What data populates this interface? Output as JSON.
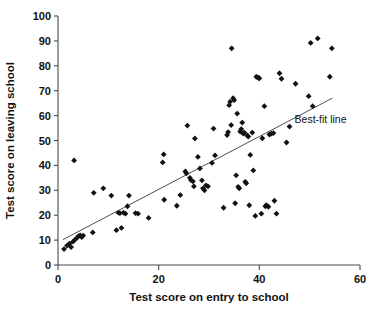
{
  "chart_data": {
    "type": "scatter",
    "title": "",
    "xlabel": "Test score on entry to school",
    "ylabel": "Test score on leaving school",
    "xlim": [
      0,
      60
    ],
    "ylim": [
      0,
      100
    ],
    "xticks": [
      0,
      20,
      40,
      60
    ],
    "yticks": [
      0,
      10,
      20,
      30,
      40,
      50,
      60,
      70,
      80,
      90,
      100
    ],
    "grid": false,
    "legend_position": "inside-right",
    "annotations": [
      {
        "name": "best-fit-line-label",
        "text": "Best-fit line",
        "x": 47,
        "y": 57
      }
    ],
    "series": [
      {
        "name": "students",
        "marker": "diamond",
        "color": "#111111",
        "points": [
          [
            1.2,
            6.4
          ],
          [
            1.8,
            7.8
          ],
          [
            2.3,
            8.6
          ],
          [
            2.6,
            7.2
          ],
          [
            3.0,
            9.4
          ],
          [
            3.2,
            42.0
          ],
          [
            3.4,
            10.2
          ],
          [
            3.8,
            11.0
          ],
          [
            4.1,
            11.6
          ],
          [
            4.4,
            11.9
          ],
          [
            4.7,
            11.2
          ],
          [
            5.0,
            11.8
          ],
          [
            6.9,
            13.1
          ],
          [
            7.1,
            29.0
          ],
          [
            9.0,
            30.8
          ],
          [
            10.6,
            27.9
          ],
          [
            11.6,
            14.0
          ],
          [
            12.0,
            21.0
          ],
          [
            12.3,
            20.8
          ],
          [
            12.6,
            14.9
          ],
          [
            13.0,
            21.0
          ],
          [
            13.4,
            20.6
          ],
          [
            13.8,
            23.6
          ],
          [
            14.1,
            27.9
          ],
          [
            15.4,
            20.8
          ],
          [
            15.9,
            20.6
          ],
          [
            18.0,
            18.9
          ],
          [
            20.8,
            41.2
          ],
          [
            21.0,
            44.4
          ],
          [
            21.1,
            26.2
          ],
          [
            23.6,
            23.8
          ],
          [
            24.3,
            28.1
          ],
          [
            25.3,
            37.6
          ],
          [
            25.5,
            36.8
          ],
          [
            25.7,
            56.0
          ],
          [
            26.2,
            35.0
          ],
          [
            26.4,
            34.1
          ],
          [
            26.8,
            33.6
          ],
          [
            27.0,
            31.6
          ],
          [
            27.2,
            50.8
          ],
          [
            27.8,
            43.4
          ],
          [
            28.2,
            38.8
          ],
          [
            28.6,
            34.0
          ],
          [
            28.8,
            30.8
          ],
          [
            29.1,
            30.0
          ],
          [
            29.4,
            32.0
          ],
          [
            29.8,
            31.6
          ],
          [
            30.6,
            41.0
          ],
          [
            30.9,
            54.8
          ],
          [
            31.2,
            44.0
          ],
          [
            32.9,
            23.0
          ],
          [
            33.6,
            52.2
          ],
          [
            33.8,
            53.4
          ],
          [
            34.0,
            64.2
          ],
          [
            34.2,
            65.6
          ],
          [
            34.4,
            56.2
          ],
          [
            34.5,
            87.0
          ],
          [
            34.8,
            67.0
          ],
          [
            35.0,
            66.2
          ],
          [
            35.2,
            24.8
          ],
          [
            35.4,
            36.0
          ],
          [
            35.6,
            60.8
          ],
          [
            35.8,
            31.4
          ],
          [
            36.0,
            30.8
          ],
          [
            36.2,
            53.6
          ],
          [
            36.4,
            54.6
          ],
          [
            36.6,
            57.2
          ],
          [
            36.8,
            52.8
          ],
          [
            37.0,
            53.2
          ],
          [
            37.2,
            33.4
          ],
          [
            37.4,
            32.8
          ],
          [
            37.6,
            52.0
          ],
          [
            37.8,
            51.6
          ],
          [
            38.0,
            24.0
          ],
          [
            38.2,
            44.2
          ],
          [
            38.6,
            53.2
          ],
          [
            38.8,
            38.0
          ],
          [
            39.2,
            19.7
          ],
          [
            39.4,
            75.6
          ],
          [
            39.8,
            75.2
          ],
          [
            40.0,
            75.0
          ],
          [
            40.4,
            20.6
          ],
          [
            40.6,
            50.9
          ],
          [
            41.0,
            63.8
          ],
          [
            41.2,
            23.6
          ],
          [
            41.4,
            24.0
          ],
          [
            41.8,
            23.4
          ],
          [
            42.0,
            52.4
          ],
          [
            42.4,
            52.8
          ],
          [
            42.8,
            53.0
          ],
          [
            43.0,
            25.8
          ],
          [
            43.4,
            20.6
          ],
          [
            44.0,
            77.0
          ],
          [
            44.4,
            74.8
          ],
          [
            45.4,
            49.2
          ],
          [
            46.0,
            55.6
          ],
          [
            47.2,
            72.8
          ],
          [
            49.8,
            67.8
          ],
          [
            50.2,
            89.2
          ],
          [
            50.6,
            63.8
          ],
          [
            51.6,
            91.0
          ],
          [
            54.0,
            75.6
          ],
          [
            54.4,
            87.0
          ]
        ]
      }
    ],
    "fit_line": {
      "name": "Best-fit line",
      "x_start": 1.0,
      "y_start": 10.2,
      "x_end": 54.5,
      "y_end": 67.0
    }
  },
  "caption": {
    "text": ""
  }
}
